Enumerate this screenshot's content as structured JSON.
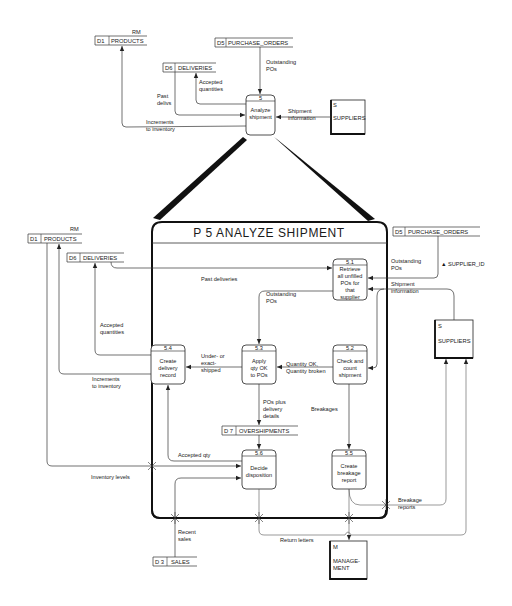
{
  "top_context": {
    "process": {
      "number": "5",
      "label_line1": "Analyze",
      "label_line2": "shipment"
    },
    "stores": {
      "d1": {
        "id": "D1",
        "name": "PRODUCTS",
        "tag": "RM"
      },
      "d5": {
        "id": "D5",
        "name": "PURCHASE_ORDERS"
      },
      "d6": {
        "id": "D6",
        "name": "DELIVERIES"
      }
    },
    "external": {
      "id": "S",
      "name": "SUPPLIERS"
    },
    "flows": {
      "outstanding_1": "Outstanding",
      "outstanding_2": "POs",
      "accepted_1": "Accepted",
      "accepted_2": "quantities",
      "past_1": "Past",
      "past_2": "delivs",
      "shipment_1": "Shipment",
      "shipment_2": "information",
      "increments_1": "Increments",
      "increments_2": "to inventory"
    }
  },
  "detail": {
    "title": "P 5   ANALYZE  SHIPMENT",
    "stores": {
      "d1": {
        "id": "D1",
        "name": "PRODUCTS",
        "tag": "RM"
      },
      "d6": {
        "id": "D6",
        "name": "DELIVERIES"
      },
      "d5": {
        "id": "D5",
        "name": "PURCHASE_ORDERS"
      },
      "d7": {
        "id": "D 7",
        "name": "OVERSHIPMENTS"
      },
      "d3": {
        "id": "D 3",
        "name": "SALES"
      }
    },
    "externals": {
      "suppliers": {
        "id": "S",
        "name": "SUPPLIERS"
      },
      "management": {
        "id": "M",
        "name_line1": "MANAGE-",
        "name_line2": "MENT"
      }
    },
    "processes": [
      {
        "number": "5.1",
        "lines": [
          "Retrieve",
          "all unfilled",
          "POs for",
          "that",
          "supplier"
        ]
      },
      {
        "number": "5.2",
        "lines": [
          "Check and",
          "count",
          "shipment"
        ]
      },
      {
        "number": "5.3",
        "lines": [
          "Apply",
          "qty OK",
          "to POs"
        ]
      },
      {
        "number": "5.4",
        "lines": [
          "Create",
          "delivery",
          "record"
        ]
      },
      {
        "number": "5.5",
        "lines": [
          "Create",
          "breakage",
          "report"
        ]
      },
      {
        "number": "5.6",
        "lines": [
          "Decide",
          "disposition"
        ]
      }
    ],
    "flows": {
      "past_deliveries": "Past deliveries",
      "outstanding_pos_1": "Outstanding",
      "outstanding_pos_2": "POs",
      "supplier_id": "▲ SUPPLIER_ID",
      "shipment_info_1": "Shipment",
      "shipment_info_2": "information",
      "outstanding_inner_1": "Outstanding",
      "outstanding_inner_2": "POs",
      "accepted_quantities_1": "Accepted",
      "accepted_quantities_2": "quantities",
      "under_1": "Under- or",
      "under_2": "exact-",
      "under_3": "shipped",
      "qty_ok_1": "Quantity OK,",
      "qty_ok_2": "Quantity broken",
      "increments_1": "Increments",
      "increments_2": "to inventory",
      "pos_plus_1": "POs plus",
      "pos_plus_2": "delivery",
      "pos_plus_3": "details",
      "breakages": "Breakages",
      "accepted_qty": "Accepted qty",
      "inventory_levels": "Inventory levels",
      "breakage_reports_1": "Breakage",
      "breakage_reports_2": "reports",
      "recent_sales_1": "Recent",
      "recent_sales_2": "sales",
      "return_letters": "Return letters"
    }
  }
}
